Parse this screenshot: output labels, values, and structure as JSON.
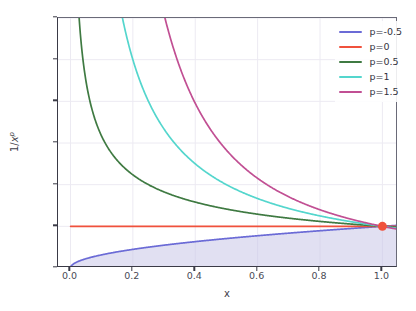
{
  "chart_data": {
    "type": "line",
    "title": "",
    "xlabel": "x",
    "ylabel": "1/x^p",
    "ylabel_base": "1/",
    "ylabel_var": "x",
    "ylabel_exp": "p",
    "xlim": [
      -0.04,
      1.05
    ],
    "ylim": [
      0,
      6
    ],
    "xticks": [
      "0.0",
      "0.2",
      "0.4",
      "0.6",
      "0.8",
      "1.0"
    ],
    "xtick_values": [
      0.0,
      0.2,
      0.4,
      0.6,
      0.8,
      1.0
    ],
    "yticks": [
      "0",
      "1",
      "2",
      "3",
      "4",
      "5",
      "6"
    ],
    "ytick_values": [
      0,
      1,
      2,
      3,
      4,
      5,
      6
    ],
    "grid": true,
    "legend_position": "upper right",
    "series": [
      {
        "name": "p=-0.5",
        "p": -0.5,
        "color": "#6b6bd6",
        "x": [
          0.0,
          0.02,
          0.05,
          0.1,
          0.15,
          0.2,
          0.3,
          0.4,
          0.5,
          0.6,
          0.7,
          0.8,
          0.9,
          1.0
        ],
        "values": [
          0.0,
          0.141,
          0.224,
          0.316,
          0.387,
          0.447,
          0.548,
          0.632,
          0.707,
          0.775,
          0.837,
          0.894,
          0.949,
          1.0
        ]
      },
      {
        "name": "p=0",
        "p": 0,
        "color": "#f0513c",
        "x": [
          0.0,
          0.2,
          0.4,
          0.6,
          0.8,
          1.0
        ],
        "values": [
          1.0,
          1.0,
          1.0,
          1.0,
          1.0,
          1.0
        ]
      },
      {
        "name": "p=0.5",
        "p": 0.5,
        "color": "#3f7a42",
        "x": [
          0.028,
          0.05,
          0.08,
          0.12,
          0.2,
          0.3,
          0.4,
          0.5,
          0.6,
          0.7,
          0.8,
          0.9,
          1.0
        ],
        "values": [
          5.98,
          4.472,
          3.536,
          2.887,
          2.236,
          1.826,
          1.581,
          1.414,
          1.291,
          1.195,
          1.118,
          1.054,
          1.0
        ]
      },
      {
        "name": "p=1",
        "p": 1,
        "color": "#54d6cd",
        "x": [
          0.167,
          0.2,
          0.25,
          0.3,
          0.4,
          0.5,
          0.6,
          0.7,
          0.8,
          0.9,
          1.0
        ],
        "values": [
          5.99,
          5.0,
          4.0,
          3.333,
          2.5,
          2.0,
          1.667,
          1.429,
          1.25,
          1.111,
          1.0
        ]
      },
      {
        "name": "p=1.5",
        "p": 1.5,
        "color": "#c14f93",
        "x": [
          0.303,
          0.35,
          0.4,
          0.45,
          0.5,
          0.6,
          0.7,
          0.8,
          0.9,
          1.0
        ],
        "values": [
          5.99,
          4.83,
          3.953,
          3.313,
          2.828,
          2.152,
          1.707,
          1.398,
          1.171,
          1.0
        ]
      }
    ],
    "fill_region": {
      "under_series": "p=-0.5",
      "color": "#c9c6e8",
      "opacity": 0.55
    },
    "marker_point": {
      "x": 1.0,
      "y": 1.0,
      "color": "#f0513c",
      "size": 9
    }
  },
  "legend": {
    "items": [
      {
        "label": "p=-0.5",
        "color": "#6b6bd6"
      },
      {
        "label": "p=0",
        "color": "#f0513c"
      },
      {
        "label": "p=0.5",
        "color": "#3f7a42"
      },
      {
        "label": "p=1",
        "color": "#54d6cd"
      },
      {
        "label": "p=1.5",
        "color": "#c14f93"
      }
    ]
  }
}
